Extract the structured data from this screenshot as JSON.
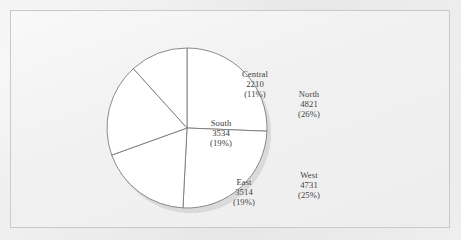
{
  "chart_data": {
    "type": "pie",
    "title": "",
    "subtitle": "",
    "xlabel": "",
    "ylabel": "",
    "legend_position": "none",
    "grid": false,
    "total": 18810,
    "categories": [
      "North",
      "West",
      "East",
      "South",
      "Central"
    ],
    "values": [
      4821,
      4731,
      3514,
      3534,
      2210
    ],
    "percents": [
      26,
      25,
      19,
      19,
      11
    ],
    "slices": [
      {
        "name": "North",
        "value": 4821,
        "percent": 26,
        "value_text": "4821",
        "percent_text": "(26%)",
        "start_angle_deg": 0,
        "end_angle_deg": 92.3,
        "fill": "#ffffff",
        "stroke": "#6f6f6f"
      },
      {
        "name": "West",
        "value": 4731,
        "percent": 25,
        "value_text": "4731",
        "percent_text": "(25%)",
        "start_angle_deg": 92.3,
        "end_angle_deg": 182.9,
        "fill": "#ffffff",
        "stroke": "#6f6f6f"
      },
      {
        "name": "East",
        "value": 3514,
        "percent": 19,
        "value_text": "3514",
        "percent_text": "(19%)",
        "start_angle_deg": 182.9,
        "end_angle_deg": 250.2,
        "fill": "#ffffff",
        "stroke": "#6f6f6f"
      },
      {
        "name": "South",
        "value": 3534,
        "percent": 19,
        "value_text": "3534",
        "percent_text": "(19%)",
        "start_angle_deg": 250.2,
        "end_angle_deg": 317.9,
        "fill": "#ffffff",
        "stroke": "#6f6f6f"
      },
      {
        "name": "Central",
        "value": 2210,
        "percent": 11,
        "value_text": "2210",
        "percent_text": "(11%)",
        "start_angle_deg": 317.9,
        "end_angle_deg": 360,
        "fill": "#ffffff",
        "stroke": "#6f6f6f"
      }
    ]
  },
  "colors": {
    "page_background": "#ececec",
    "frame_background": "#f0f0f0",
    "frame_border": "#c9c9c9",
    "slice_fill": "#ffffff",
    "slice_outline": "#6f6f6f",
    "label_text": "#3a3a3a",
    "shadow": "#c4c4c4"
  },
  "geometry": {
    "center_x": 90,
    "center_y": 96,
    "radius": 80,
    "shadow_offset_x": 4,
    "shadow_offset_y": 5
  }
}
